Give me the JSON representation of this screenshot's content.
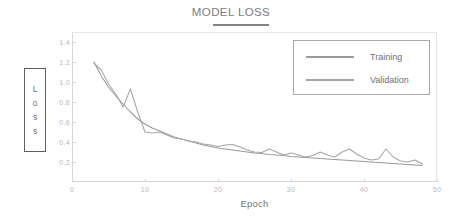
{
  "chart_data": {
    "type": "line",
    "title": "MODEL LOSS",
    "xlabel": "Epoch",
    "ylabel": "Loss",
    "xlim": [
      0,
      50
    ],
    "ylim": [
      0.0,
      1.5
    ],
    "xticks": [
      0,
      10,
      20,
      30,
      40,
      50
    ],
    "yticks": [
      0.2,
      0.4,
      0.6,
      0.8,
      1.0,
      1.2,
      1.4
    ],
    "xtick_labels": [
      "0",
      "10",
      "20",
      "30",
      "40",
      "50"
    ],
    "ytick_labels": [
      "0.2",
      "0.4",
      "0.6",
      "0.8",
      "1.0",
      "1.2",
      "1.4"
    ],
    "grid": false,
    "legend_position": "upper right",
    "x": [
      3,
      4,
      5,
      6,
      7,
      8,
      9,
      10,
      11,
      12,
      13,
      14,
      15,
      16,
      17,
      18,
      19,
      20,
      21,
      22,
      23,
      24,
      25,
      26,
      27,
      28,
      29,
      30,
      31,
      32,
      33,
      34,
      35,
      36,
      37,
      38,
      39,
      40,
      41,
      42,
      43,
      44,
      45,
      46,
      47,
      48
    ],
    "series": [
      {
        "name": "Training",
        "color": "#9a9a9d",
        "values": [
          1.2,
          1.06,
          0.95,
          0.86,
          0.78,
          0.7,
          0.63,
          0.58,
          0.54,
          0.51,
          0.48,
          0.45,
          0.43,
          0.41,
          0.39,
          0.37,
          0.355,
          0.34,
          0.33,
          0.32,
          0.31,
          0.3,
          0.29,
          0.285,
          0.275,
          0.27,
          0.265,
          0.255,
          0.25,
          0.245,
          0.24,
          0.235,
          0.23,
          0.225,
          0.22,
          0.215,
          0.21,
          0.205,
          0.2,
          0.195,
          0.19,
          0.185,
          0.18,
          0.175,
          0.17,
          0.165
        ]
      },
      {
        "name": "Validation",
        "color": "#a6a6a9",
        "values": [
          1.19,
          1.12,
          0.98,
          0.88,
          0.75,
          0.93,
          0.7,
          0.5,
          0.49,
          0.5,
          0.47,
          0.44,
          0.43,
          0.41,
          0.4,
          0.38,
          0.37,
          0.355,
          0.37,
          0.375,
          0.35,
          0.32,
          0.3,
          0.295,
          0.33,
          0.3,
          0.27,
          0.29,
          0.27,
          0.25,
          0.265,
          0.3,
          0.27,
          0.25,
          0.3,
          0.33,
          0.28,
          0.24,
          0.22,
          0.23,
          0.33,
          0.25,
          0.21,
          0.2,
          0.22,
          0.18
        ]
      }
    ],
    "annotations": {
      "validation_spike_epoch_8": 0.93,
      "validation_spike_epoch_43": 0.33
    }
  },
  "legend": {
    "items": [
      {
        "label": "Training"
      },
      {
        "label": "Validation"
      }
    ]
  },
  "ylabel_letters": [
    "L",
    "o",
    "s",
    "s"
  ]
}
